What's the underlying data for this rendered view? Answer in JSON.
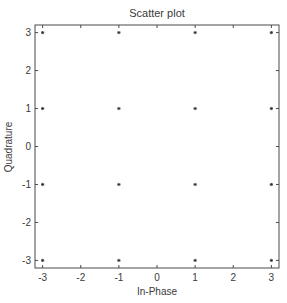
{
  "chart_data": {
    "type": "scatter",
    "title": "Scatter plot",
    "xlabel": "In-Phase",
    "ylabel": "Quadrature",
    "xlim": [
      -3.2,
      3.2
    ],
    "ylim": [
      -3.2,
      3.2
    ],
    "xticks": [
      -3,
      -2,
      -1,
      0,
      1,
      2,
      3
    ],
    "yticks": [
      -3,
      -2,
      -1,
      0,
      1,
      2,
      3
    ],
    "xtick_labels": [
      "-3",
      "-2",
      "-1",
      "0",
      "1",
      "2",
      "3"
    ],
    "ytick_labels": [
      "-3",
      "-2",
      "-1",
      "0",
      "1",
      "2",
      "3"
    ],
    "grid": false,
    "legend": null,
    "marker": "*",
    "marker_color": "#333333",
    "series": [
      {
        "name": "constellation",
        "points": [
          {
            "x": -3,
            "y": 3
          },
          {
            "x": -1,
            "y": 3
          },
          {
            "x": 1,
            "y": 3
          },
          {
            "x": 3,
            "y": 3
          },
          {
            "x": -3,
            "y": 1
          },
          {
            "x": -1,
            "y": 1
          },
          {
            "x": 1,
            "y": 1
          },
          {
            "x": 3,
            "y": 1
          },
          {
            "x": -3,
            "y": -1
          },
          {
            "x": -1,
            "y": -1
          },
          {
            "x": 1,
            "y": -1
          },
          {
            "x": 3,
            "y": -1
          },
          {
            "x": -3,
            "y": -3
          },
          {
            "x": -1,
            "y": -3
          },
          {
            "x": 1,
            "y": -3
          },
          {
            "x": 3,
            "y": -3
          }
        ]
      }
    ]
  }
}
